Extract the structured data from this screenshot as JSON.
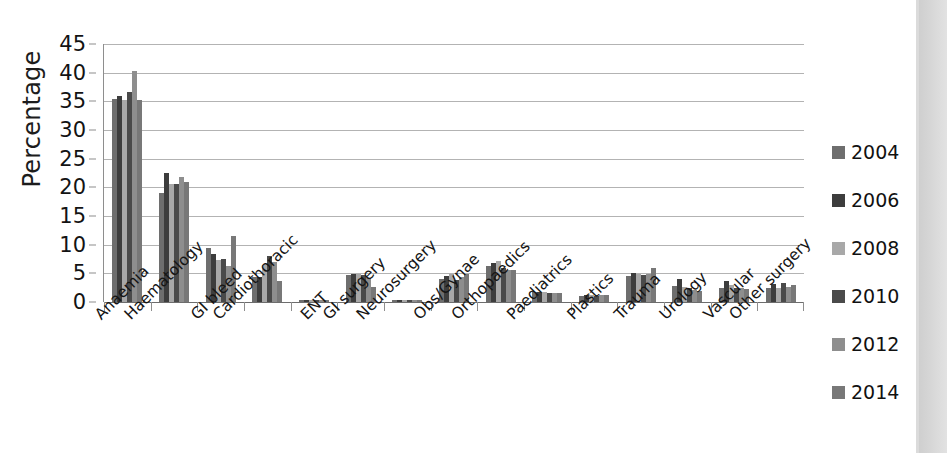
{
  "chart_data": {
    "type": "bar",
    "title": "",
    "xlabel": "",
    "ylabel": "Percentage",
    "ylim": [
      0,
      45
    ],
    "yticks": [
      0,
      5,
      10,
      15,
      20,
      25,
      30,
      35,
      40,
      45
    ],
    "grid": true,
    "legend_position": "right",
    "categories": [
      "Anaemia",
      "Haematology",
      "GI bleed",
      "Cardiothoracic",
      "ENT",
      "GI surgery",
      "Neurosurgery",
      "Obs/Gynae",
      "Orthopaedics",
      "Paediatrics",
      "Plastics",
      "Trauma",
      "Urology",
      "Vascular",
      "Other surgery"
    ],
    "series": [
      {
        "name": "2004",
        "color": "#6e6e6e",
        "values": [
          35.4,
          19.0,
          9.5,
          4.4,
          0.3,
          4.7,
          0.3,
          4.1,
          6.2,
          1.7,
          1.1,
          4.6,
          2.8,
          2.5,
          2.5
        ]
      },
      {
        "name": "2006",
        "color": "#3d3d3d",
        "values": [
          36.0,
          22.5,
          8.4,
          4.4,
          0.3,
          4.9,
          0.3,
          4.6,
          6.8,
          1.8,
          1.2,
          5.0,
          4.0,
          3.6,
          3.1
        ]
      },
      {
        "name": "2008",
        "color": "#a8a8a8",
        "values": [
          35.2,
          20.5,
          7.3,
          6.5,
          0.3,
          4.9,
          0.3,
          4.8,
          7.1,
          1.7,
          1.2,
          4.8,
          2.6,
          2.9,
          2.5
        ]
      },
      {
        "name": "2010",
        "color": "#4a4a4a",
        "values": [
          36.7,
          20.6,
          7.5,
          8.0,
          0.3,
          4.7,
          0.3,
          3.9,
          6.0,
          1.6,
          1.0,
          4.7,
          2.4,
          2.5,
          3.4
        ]
      },
      {
        "name": "2012",
        "color": "#8e8e8e",
        "values": [
          40.3,
          21.8,
          6.2,
          7.0,
          0.3,
          4.2,
          0.3,
          4.3,
          5.6,
          1.5,
          1.2,
          4.8,
          2.1,
          2.4,
          2.6
        ]
      },
      {
        "name": "2014",
        "color": "#787878",
        "values": [
          35.2,
          21.0,
          11.6,
          3.6,
          0.3,
          2.7,
          0.3,
          4.9,
          5.6,
          1.5,
          1.3,
          5.9,
          2.0,
          2.3,
          3.0
        ]
      }
    ]
  },
  "legend": {
    "items": [
      {
        "label": "2004",
        "color": "#6e6e6e"
      },
      {
        "label": "2006",
        "color": "#3d3d3d"
      },
      {
        "label": "2008",
        "color": "#a8a8a8"
      },
      {
        "label": "2010",
        "color": "#4a4a4a"
      },
      {
        "label": "2012",
        "color": "#8e8e8e"
      },
      {
        "label": "2014",
        "color": "#787878"
      }
    ]
  }
}
